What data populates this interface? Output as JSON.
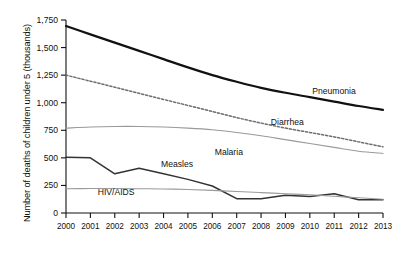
{
  "chart_data": {
    "type": "line",
    "title": "",
    "xlabel": "",
    "ylabel": "Number of deaths of children under 5 (thousands)",
    "x": [
      2000,
      2001,
      2002,
      2003,
      2004,
      2005,
      2006,
      2007,
      2008,
      2009,
      2010,
      2011,
      2012,
      2013
    ],
    "xticklabels": [
      "2000",
      "2001",
      "2002",
      "2003",
      "2004",
      "2005",
      "2006",
      "2007",
      "2008",
      "2009",
      "2010",
      "2011",
      "2012",
      "2013"
    ],
    "yticks": [
      0,
      250,
      500,
      750,
      1000,
      1250,
      1500,
      1750
    ],
    "yticklabels": [
      "0",
      "250",
      "500",
      "750",
      "1,000",
      "1,250",
      "1,500",
      "1,750"
    ],
    "ylim": [
      0,
      1750
    ],
    "xlim": [
      2000,
      2013
    ],
    "grid": false,
    "legend_position": "inline-labels",
    "series": [
      {
        "name": "Pneumonia",
        "style": "solid-thick",
        "color": "#111111",
        "label_x": 2010.1,
        "label_y": 1075,
        "values": [
          1695,
          1620,
          1545,
          1470,
          1395,
          1320,
          1250,
          1190,
          1135,
          1090,
          1050,
          1010,
          970,
          935
        ]
      },
      {
        "name": "Diarrhea",
        "style": "dotted",
        "color": "#6e6e6e",
        "label_x": 2008.4,
        "label_y": 800,
        "values": [
          1250,
          1195,
          1140,
          1085,
          1030,
          975,
          920,
          865,
          815,
          770,
          730,
          690,
          645,
          600
        ]
      },
      {
        "name": "Malaria",
        "style": "solid-thin",
        "color": "#9a9a9a",
        "label_x": 2006.1,
        "label_y": 530,
        "values": [
          770,
          780,
          785,
          785,
          780,
          770,
          755,
          730,
          700,
          665,
          630,
          595,
          560,
          540
        ]
      },
      {
        "name": "Measles",
        "style": "solid-medium",
        "color": "#333333",
        "label_x": 2003.9,
        "label_y": 415,
        "values": [
          505,
          500,
          355,
          405,
          355,
          305,
          245,
          130,
          130,
          160,
          150,
          175,
          120,
          120
        ]
      },
      {
        "name": "HIV/AIDS",
        "style": "solid-thin",
        "color": "#9a9a9a",
        "label_x": 2001.3,
        "label_y": 160,
        "values": [
          220,
          222,
          222,
          220,
          218,
          213,
          205,
          195,
          185,
          175,
          165,
          152,
          138,
          125
        ]
      }
    ]
  }
}
